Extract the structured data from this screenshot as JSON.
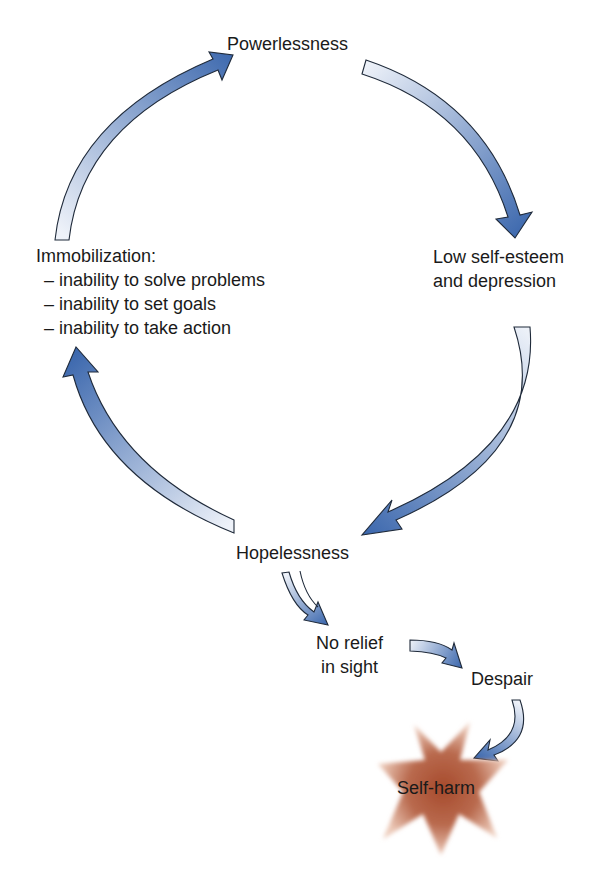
{
  "diagram": {
    "type": "cycle-flow",
    "colors": {
      "arrow_dark": "#3b67ad",
      "arrow_light": "#e9eef7",
      "arrow_outline": "#1f2a3a",
      "star_center": "#a64a2c",
      "star_edge": "#e2b9a6",
      "text": "#1a1a1a"
    },
    "nodes": {
      "powerlessness": {
        "label": "Powerlessness"
      },
      "low_self_esteem": {
        "line1": "Low self-esteem",
        "line2": "and depression"
      },
      "hopelessness": {
        "label": "Hopelessness"
      },
      "immobilization": {
        "title": "Immobilization:",
        "items": [
          "– inability to solve problems",
          "– inability to set goals",
          "– inability to take action"
        ]
      },
      "no_relief": {
        "line1": "No relief",
        "line2": "in sight"
      },
      "despair": {
        "label": "Despair"
      },
      "self_harm": {
        "label": "Self-harm"
      }
    },
    "edges": [
      {
        "from": "powerlessness",
        "to": "low_self_esteem"
      },
      {
        "from": "low_self_esteem",
        "to": "hopelessness"
      },
      {
        "from": "hopelessness",
        "to": "immobilization"
      },
      {
        "from": "immobilization",
        "to": "powerlessness"
      },
      {
        "from": "hopelessness",
        "to": "no_relief"
      },
      {
        "from": "no_relief",
        "to": "despair"
      },
      {
        "from": "despair",
        "to": "self_harm"
      }
    ]
  }
}
